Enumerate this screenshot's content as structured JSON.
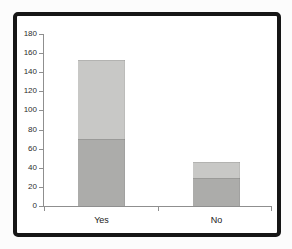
{
  "chart_data": {
    "type": "bar",
    "stacked": true,
    "title": "",
    "xlabel": "",
    "ylabel": "",
    "categories": [
      "Yes",
      "No"
    ],
    "series": [
      {
        "name": "bottom-segment",
        "color": "#acacaa",
        "values": [
          70,
          29
        ]
      },
      {
        "name": "top-segment",
        "color": "#c8c8c6",
        "values": [
          83,
          17
        ]
      }
    ],
    "totals": [
      153,
      46
    ],
    "y_axis": {
      "min": 0,
      "max": 180,
      "step": 20,
      "ticks": [
        180,
        160,
        140,
        120,
        100,
        80,
        60,
        40,
        20,
        0
      ],
      "tick_labels": [
        "180",
        "160",
        "140",
        "120",
        "100",
        "80",
        "60",
        "40",
        "20",
        "0"
      ]
    },
    "x_axis": {
      "tick_count": 3
    },
    "legend": "none",
    "grid": false
  },
  "frame": {
    "border_color": "#161616",
    "background": "#ffffff"
  },
  "axis_style": {
    "line_color": "#8f8f8f",
    "label_color": "#2d2d2d"
  }
}
